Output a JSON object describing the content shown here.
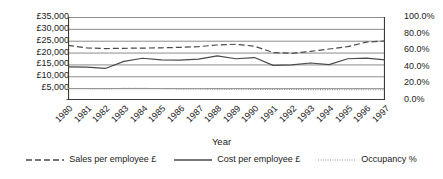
{
  "chart_data": {
    "type": "line",
    "title": "",
    "xlabel": "Year",
    "ylabel": "",
    "grid": true,
    "legend_position": "bottom",
    "categories": [
      "1980",
      "1981",
      "1982",
      "1983",
      "1984",
      "1985",
      "1986",
      "1987",
      "1988",
      "1989",
      "1990",
      "1991",
      "1992",
      "1993",
      "1994",
      "1995",
      "1996",
      "1997"
    ],
    "axes": {
      "left": {
        "label": "",
        "ylim": [
          0,
          35000
        ],
        "ticks": [
          0,
          5000,
          10000,
          15000,
          20000,
          25000,
          30000,
          35000
        ],
        "ticklabels": [
          "-",
          "£5,000",
          "£10,000",
          "£15,000",
          "£20,000",
          "£25,000",
          "£30,000",
          "£35,000"
        ]
      },
      "right": {
        "label": "",
        "ylim": [
          0,
          100
        ],
        "ticks": [
          0,
          20,
          40,
          60,
          80,
          100
        ],
        "ticklabels": [
          "0.0%",
          "20.0%",
          "40.0%",
          "60.0%",
          "80.0%",
          "100.0%"
        ]
      }
    },
    "series": [
      {
        "name": "Sales per employee £",
        "axis": "left",
        "style": "dashed",
        "color": "#4a4a4a",
        "values": [
          23000,
          22000,
          21700,
          21800,
          21900,
          22000,
          22200,
          22500,
          23200,
          23500,
          22700,
          20000,
          19700,
          20500,
          21500,
          22500,
          24400,
          24900
        ]
      },
      {
        "name": "Cost per employee £",
        "axis": "left",
        "style": "solid",
        "color": "#4a4a4a",
        "values": [
          14000,
          13900,
          13300,
          16300,
          17600,
          16900,
          16800,
          17200,
          18600,
          17400,
          17900,
          14600,
          14800,
          15600,
          14900,
          17400,
          17700,
          16900
        ]
      },
      {
        "name": "Occupancy %",
        "axis": "right",
        "style": "dotted",
        "color": "#8f8f8f",
        "values": [
          13.8,
          13.8,
          13.6,
          14.0,
          14.0,
          13.8,
          13.4,
          13.2,
          13.1,
          13.0,
          12.8,
          12.6,
          12.6,
          12.5,
          12.5,
          12.4,
          12.4,
          12.3
        ]
      }
    ]
  },
  "legend": {
    "items": [
      {
        "label": "Sales per employee £",
        "style": "dashed"
      },
      {
        "label": "Cost per employee £",
        "style": "solid"
      },
      {
        "label": "Occupancy %",
        "style": "dotted"
      }
    ]
  }
}
